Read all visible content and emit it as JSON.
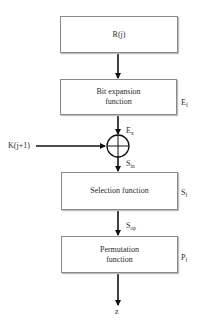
{
  "diagram": {
    "nodes": [
      {
        "id": "rj",
        "label": "R(j)"
      },
      {
        "id": "expansion",
        "label": "Bit expansion function",
        "side_label": "E",
        "side_sub": "f"
      },
      {
        "id": "xor",
        "label": "⊕"
      },
      {
        "id": "selection",
        "label": "Selection function",
        "side_label": "S",
        "side_sub": "f"
      },
      {
        "id": "permutation",
        "label": "Permutation function",
        "side_label": "P",
        "side_sub": "f"
      }
    ],
    "edges": [
      {
        "from": "rj",
        "to": "expansion",
        "label": ""
      },
      {
        "from": "expansion",
        "to": "xor",
        "label": "E",
        "sub": "x"
      },
      {
        "from": "key",
        "to": "xor",
        "label": "K(j+1)"
      },
      {
        "from": "xor",
        "to": "selection",
        "label": "S",
        "sub": "in"
      },
      {
        "from": "selection",
        "to": "permutation",
        "label": "S",
        "sub": "op"
      },
      {
        "from": "permutation",
        "to": "output",
        "label": "z"
      }
    ],
    "text": {
      "rj": "R(j)",
      "exp_line1": "Bit expansion",
      "exp_line2": "function",
      "ef": "E",
      "ef_sub": "f",
      "ex": "E",
      "ex_sub": "x",
      "key": "K(j+1)",
      "sin": "S",
      "sin_sub": "in",
      "selection": "Selection function",
      "sf": "S",
      "sf_sub": "f",
      "sop": "S",
      "sop_sub": "op",
      "perm_line1": "Permutation",
      "perm_line2": "function",
      "pf": "P",
      "pf_sub": "f",
      "z": "z"
    }
  }
}
